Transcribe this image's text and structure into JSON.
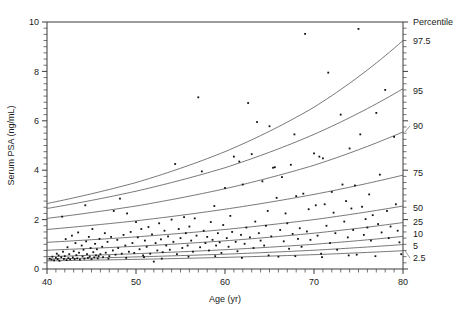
{
  "chart_data": {
    "type": "scatter",
    "title": "",
    "xlabel": "Age (yr)",
    "ylabel": "Serum PSA (ng/mL)",
    "xlim": [
      40,
      80
    ],
    "ylim": [
      0,
      10
    ],
    "x_ticks": [
      40,
      50,
      60,
      70,
      80
    ],
    "y_ticks": [
      0,
      2,
      4,
      6,
      8,
      10
    ],
    "x_minor_step": 1,
    "y_minor_step": 0.25,
    "grid": false,
    "legend_position": "right-outside",
    "legend_title": "Percentile",
    "series": [
      {
        "name": "Observations",
        "type": "scatter",
        "marker": "square",
        "color": "#111111",
        "points": [
          [
            40.3,
            0.42
          ],
          [
            40.5,
            0.38
          ],
          [
            40.6,
            0.5
          ],
          [
            40.8,
            0.35
          ],
          [
            41.0,
            0.45
          ],
          [
            41.1,
            0.62
          ],
          [
            41.2,
            0.4
          ],
          [
            41.3,
            0.55
          ],
          [
            41.4,
            0.33
          ],
          [
            41.6,
            0.48
          ],
          [
            41.7,
            2.12
          ],
          [
            41.8,
            0.7
          ],
          [
            41.9,
            0.41
          ],
          [
            42.0,
            0.52
          ],
          [
            42.1,
            1.21
          ],
          [
            42.2,
            0.36
          ],
          [
            42.3,
            0.88
          ],
          [
            42.4,
            0.44
          ],
          [
            42.5,
            0.6
          ],
          [
            42.6,
            0.39
          ],
          [
            42.8,
            1.35
          ],
          [
            42.9,
            0.47
          ],
          [
            43.0,
            0.72
          ],
          [
            43.1,
            0.4
          ],
          [
            43.2,
            1.05
          ],
          [
            43.3,
            0.56
          ],
          [
            43.4,
            0.43
          ],
          [
            43.5,
            1.48
          ],
          [
            43.6,
            0.66
          ],
          [
            43.7,
            0.38
          ],
          [
            43.9,
            0.95
          ],
          [
            44.0,
            0.51
          ],
          [
            44.1,
            0.78
          ],
          [
            44.2,
            0.42
          ],
          [
            44.3,
            2.58
          ],
          [
            44.4,
            1.12
          ],
          [
            44.5,
            0.6
          ],
          [
            44.6,
            0.45
          ],
          [
            44.7,
            1.3
          ],
          [
            44.8,
            0.5
          ],
          [
            44.9,
            0.85
          ],
          [
            45.0,
            0.4
          ],
          [
            45.1,
            1.62
          ],
          [
            45.2,
            0.68
          ],
          [
            45.3,
            0.47
          ],
          [
            45.4,
            1.02
          ],
          [
            45.5,
            0.55
          ],
          [
            45.6,
            0.8
          ],
          [
            45.7,
            0.43
          ],
          [
            45.9,
            1.22
          ],
          [
            46.0,
            0.6
          ],
          [
            46.2,
            0.9
          ],
          [
            46.3,
            0.48
          ],
          [
            46.5,
            1.45
          ],
          [
            46.6,
            0.66
          ],
          [
            46.8,
            1.1
          ],
          [
            47.0,
            0.52
          ],
          [
            47.2,
            1.3
          ],
          [
            47.4,
            0.75
          ],
          [
            47.5,
            2.35
          ],
          [
            47.7,
            0.58
          ],
          [
            47.9,
            1.18
          ],
          [
            48.0,
            0.85
          ],
          [
            48.2,
            2.85
          ],
          [
            48.4,
            0.62
          ],
          [
            48.6,
            1.38
          ],
          [
            48.8,
            0.95
          ],
          [
            49.0,
            2.25
          ],
          [
            49.2,
            0.7
          ],
          [
            49.4,
            1.5
          ],
          [
            49.6,
            1.05
          ],
          [
            49.8,
            0.65
          ],
          [
            50.0,
            1.9
          ],
          [
            50.2,
            1.28
          ],
          [
            50.4,
            0.8
          ],
          [
            50.6,
            1.62
          ],
          [
            50.8,
            0.55
          ],
          [
            51.0,
            1.15
          ],
          [
            51.2,
            0.9
          ],
          [
            51.4,
            1.7
          ],
          [
            51.6,
            0.62
          ],
          [
            51.8,
            1.4
          ],
          [
            52.0,
            0.3
          ],
          [
            52.2,
            1.05
          ],
          [
            52.4,
            0.75
          ],
          [
            52.6,
            1.85
          ],
          [
            52.8,
            1.2
          ],
          [
            53.0,
            0.68
          ],
          [
            53.2,
            1.55
          ],
          [
            53.4,
            0.95
          ],
          [
            53.6,
            1.32
          ],
          [
            53.8,
            0.78
          ],
          [
            54.0,
            2.0
          ],
          [
            54.2,
            1.1
          ],
          [
            54.4,
            4.25
          ],
          [
            54.6,
            0.6
          ],
          [
            54.8,
            1.62
          ],
          [
            55.0,
            1.25
          ],
          [
            55.2,
            0.85
          ],
          [
            55.4,
            2.1
          ],
          [
            55.6,
            1.45
          ],
          [
            55.8,
            0.95
          ],
          [
            56.0,
            1.72
          ],
          [
            56.2,
            1.15
          ],
          [
            56.4,
            0.7
          ],
          [
            56.6,
            2.05
          ],
          [
            56.8,
            1.35
          ],
          [
            57.0,
            6.95
          ],
          [
            57.2,
            0.88
          ],
          [
            57.4,
            3.95
          ],
          [
            57.6,
            1.55
          ],
          [
            57.8,
            1.05
          ],
          [
            58.0,
            1.3
          ],
          [
            58.2,
            0.75
          ],
          [
            58.4,
            1.9
          ],
          [
            58.6,
            1.18
          ],
          [
            58.8,
            2.55
          ],
          [
            59.0,
            0.95
          ],
          [
            59.2,
            1.45
          ],
          [
            59.4,
            1.08
          ],
          [
            59.6,
            0.65
          ],
          [
            59.8,
            1.78
          ],
          [
            60.0,
            3.28
          ],
          [
            60.2,
            1.25
          ],
          [
            60.4,
            0.9
          ],
          [
            60.6,
            2.15
          ],
          [
            60.8,
            1.5
          ],
          [
            61.0,
            4.55
          ],
          [
            61.2,
            1.1
          ],
          [
            61.4,
            0.72
          ],
          [
            61.6,
            4.35
          ],
          [
            61.8,
            1.38
          ],
          [
            62.0,
            3.42
          ],
          [
            62.2,
            1.02
          ],
          [
            62.4,
            1.68
          ],
          [
            62.6,
            6.72
          ],
          [
            62.8,
            1.28
          ],
          [
            63.0,
            4.65
          ],
          [
            63.2,
            0.85
          ],
          [
            63.4,
            1.92
          ],
          [
            63.6,
            5.95
          ],
          [
            63.8,
            1.45
          ],
          [
            64.0,
            1.15
          ],
          [
            64.2,
            3.55
          ],
          [
            64.4,
            0.95
          ],
          [
            64.6,
            1.75
          ],
          [
            64.8,
            2.35
          ],
          [
            65.0,
            5.78
          ],
          [
            65.2,
            1.32
          ],
          [
            65.4,
            4.1
          ],
          [
            65.6,
            4.12
          ],
          [
            65.8,
            2.88
          ],
          [
            66.0,
            0.5
          ],
          [
            66.2,
            1.58
          ],
          [
            66.4,
            3.72
          ],
          [
            66.6,
            1.12
          ],
          [
            66.8,
            2.25
          ],
          [
            67.0,
            1.85
          ],
          [
            67.2,
            0.82
          ],
          [
            67.4,
            4.22
          ],
          [
            67.6,
            1.42
          ],
          [
            67.8,
            5.45
          ],
          [
            68.0,
            2.95
          ],
          [
            68.2,
            1.22
          ],
          [
            68.4,
            1.65
          ],
          [
            68.6,
            0.9
          ],
          [
            68.8,
            3.05
          ],
          [
            69.0,
            9.52
          ],
          [
            69.2,
            1.52
          ],
          [
            69.4,
            2.42
          ],
          [
            69.6,
            1.18
          ],
          [
            70.0,
            4.68
          ],
          [
            70.2,
            2.58
          ],
          [
            70.4,
            1.35
          ],
          [
            70.6,
            4.55
          ],
          [
            70.8,
            0.62
          ],
          [
            71.0,
            4.48
          ],
          [
            71.2,
            2.62
          ],
          [
            71.4,
            1.75
          ],
          [
            71.6,
            7.95
          ],
          [
            71.8,
            1.05
          ],
          [
            72.0,
            3.12
          ],
          [
            72.2,
            2.28
          ],
          [
            72.4,
            1.45
          ],
          [
            72.6,
            0.78
          ],
          [
            73.0,
            6.25
          ],
          [
            73.2,
            3.42
          ],
          [
            73.4,
            1.92
          ],
          [
            73.6,
            2.75
          ],
          [
            73.8,
            1.28
          ],
          [
            74.0,
            4.88
          ],
          [
            74.2,
            2.45
          ],
          [
            74.4,
            1.58
          ],
          [
            74.6,
            3.38
          ],
          [
            74.8,
            0.58
          ],
          [
            75.0,
            9.72
          ],
          [
            75.2,
            5.45
          ],
          [
            75.4,
            2.52
          ],
          [
            75.6,
            1.38
          ],
          [
            75.8,
            2.02
          ],
          [
            76.0,
            1.68
          ],
          [
            76.2,
            3.02
          ],
          [
            76.4,
            1.15
          ],
          [
            76.6,
            2.18
          ],
          [
            77.0,
            6.32
          ],
          [
            77.2,
            1.82
          ],
          [
            77.4,
            3.82
          ],
          [
            77.6,
            1.48
          ],
          [
            78.0,
            7.25
          ],
          [
            78.2,
            2.35
          ],
          [
            78.4,
            1.25
          ],
          [
            78.6,
            1.72
          ],
          [
            79.0,
            5.35
          ],
          [
            79.2,
            2.62
          ],
          [
            79.4,
            1.55
          ],
          [
            79.6,
            1.08
          ],
          [
            45.8,
            0.52
          ],
          [
            46.9,
            0.42
          ],
          [
            48.9,
            0.45
          ],
          [
            50.9,
            0.48
          ],
          [
            52.9,
            0.42
          ],
          [
            55.9,
            0.5
          ],
          [
            58.9,
            0.52
          ],
          [
            61.9,
            0.45
          ],
          [
            64.9,
            0.55
          ],
          [
            67.9,
            0.52
          ],
          [
            70.9,
            0.48
          ],
          [
            73.9,
            0.55
          ],
          [
            76.9,
            0.52
          ],
          [
            79.8,
            0.6
          ]
        ]
      },
      {
        "name": "2.5",
        "type": "curve",
        "color": "#555555",
        "values_at": {
          "40": 0.33,
          "50": 0.39,
          "60": 0.47,
          "70": 0.58,
          "80": 0.74
        }
      },
      {
        "name": "5",
        "type": "curve",
        "color": "#555555",
        "values_at": {
          "40": 0.4,
          "50": 0.49,
          "60": 0.6,
          "70": 0.76,
          "80": 0.99
        }
      },
      {
        "name": "10",
        "type": "curve",
        "color": "#555555",
        "values_at": {
          "40": 0.5,
          "50": 0.62,
          "60": 0.78,
          "70": 1.0,
          "80": 1.32
        }
      },
      {
        "name": "25",
        "type": "curve",
        "color": "#555555",
        "values_at": {
          "40": 0.76,
          "50": 0.92,
          "60": 1.14,
          "70": 1.45,
          "80": 1.88
        }
      },
      {
        "name": "50",
        "type": "curve",
        "color": "#555555",
        "values_at": {
          "40": 1.08,
          "50": 1.3,
          "60": 1.6,
          "70": 2.0,
          "80": 2.55
        }
      },
      {
        "name": "75",
        "type": "curve",
        "color": "#555555",
        "values_at": {
          "40": 1.6,
          "50": 1.95,
          "60": 2.42,
          "70": 3.02,
          "80": 3.8
        }
      },
      {
        "name": "90",
        "type": "curve",
        "color": "#555555",
        "values_at": {
          "40": 2.05,
          "50": 2.55,
          "60": 3.25,
          "70": 4.2,
          "80": 5.55
        }
      },
      {
        "name": "95",
        "type": "curve",
        "color": "#555555",
        "values_at": {
          "40": 2.45,
          "50": 3.15,
          "60": 4.1,
          "70": 5.45,
          "80": 7.3
        }
      },
      {
        "name": "97.5",
        "type": "curve",
        "color": "#555555",
        "values_at": {
          "40": 2.65,
          "50": 3.5,
          "60": 4.75,
          "70": 6.55,
          "80": 9.25
        }
      }
    ],
    "percentile_labels": [
      "97.5",
      "95",
      "90",
      "75",
      "50",
      "25",
      "10",
      "5",
      "2.5"
    ]
  },
  "axes": {
    "y_tick_labels": [
      "10",
      "8",
      "6",
      "4",
      "2",
      "0"
    ],
    "x_tick_labels": [
      "40",
      "50",
      "60",
      "70",
      "80"
    ],
    "x_title": "Age (yr)",
    "y_title": "Serum PSA (ng/mL)"
  },
  "legend": {
    "header": "Percentile",
    "entries": [
      "97.5",
      "95",
      "90",
      "75",
      "50",
      "25",
      "10",
      "5",
      "2.5"
    ]
  },
  "colors": {
    "axis": "#3a3a3a",
    "curve": "#555555",
    "point": "#111111",
    "text": "#1a1a1a",
    "background": "#ffffff"
  }
}
